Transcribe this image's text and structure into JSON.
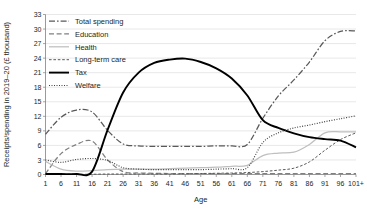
{
  "chart_data": {
    "type": "line",
    "title": "",
    "xlabel": "Age",
    "ylabel": "Receipts/spending in 2019–20 (£ thousand)",
    "ylim": [
      0,
      33
    ],
    "ytick_step": 3,
    "yticks": [
      "0",
      "3",
      "6",
      "9",
      "12",
      "15",
      "18",
      "21",
      "24",
      "27",
      "30",
      "33"
    ],
    "xticks": [
      "1",
      "6",
      "11",
      "16",
      "21",
      "26",
      "31",
      "36",
      "41",
      "46",
      "51",
      "56",
      "61",
      "66",
      "71",
      "76",
      "81",
      "86",
      "91",
      "96",
      "101+"
    ],
    "xlim": [
      1,
      101
    ],
    "grid": "horizontal",
    "legend_position": "top-left-inside",
    "x": [
      1,
      6,
      11,
      16,
      21,
      26,
      31,
      36,
      41,
      46,
      51,
      56,
      61,
      66,
      71,
      76,
      81,
      86,
      91,
      96,
      101
    ],
    "series": [
      {
        "name": "Total spending",
        "style": "dash-dot",
        "color": "#595959",
        "values": [
          8.3,
          11.8,
          13.3,
          12.9,
          9.1,
          6.3,
          5.9,
          5.8,
          5.8,
          5.8,
          5.8,
          5.9,
          5.9,
          6.2,
          11.6,
          16.2,
          19.5,
          23.2,
          27.6,
          29.5,
          29.6
        ]
      },
      {
        "name": "Education",
        "style": "dashed",
        "color": "#808080",
        "values": [
          0.2,
          4.3,
          6.2,
          6.9,
          3.0,
          0.6,
          0.3,
          0.25,
          0.2,
          0.2,
          0.2,
          0.2,
          0.2,
          0.2,
          0.2,
          0.2,
          0.2,
          0.2,
          0.2,
          0.2,
          0.2
        ]
      },
      {
        "name": "Health",
        "style": "solid-light",
        "color": "#bfbfbf",
        "values": [
          2.7,
          1.1,
          0.7,
          0.8,
          1.0,
          1.1,
          1.1,
          1.1,
          1.2,
          1.3,
          1.4,
          1.5,
          1.7,
          1.9,
          3.9,
          4.4,
          4.6,
          6.2,
          8.6,
          8.8,
          8.8
        ]
      },
      {
        "name": "Long-term care",
        "style": "fine-dashed",
        "color": "#595959",
        "values": [
          0.05,
          0.05,
          0.05,
          0.05,
          0.1,
          0.1,
          0.1,
          0.1,
          0.1,
          0.15,
          0.2,
          0.25,
          0.3,
          0.4,
          0.6,
          0.9,
          1.3,
          2.6,
          5.0,
          7.2,
          8.6
        ]
      },
      {
        "name": "Tax",
        "style": "solid-bold",
        "color": "#000000",
        "values": [
          0.1,
          0.1,
          0.1,
          0.6,
          9.2,
          16.9,
          21.0,
          23.0,
          23.7,
          23.9,
          23.2,
          21.9,
          19.8,
          16.3,
          11.2,
          9.6,
          8.5,
          7.7,
          7.3,
          7.0,
          5.6
        ]
      },
      {
        "name": "Welfare",
        "style": "dotted",
        "color": "#404040",
        "values": [
          3.0,
          2.5,
          3.1,
          3.3,
          2.9,
          1.4,
          1.1,
          1.0,
          1.0,
          1.0,
          1.0,
          1.1,
          1.2,
          1.4,
          6.6,
          8.6,
          9.6,
          10.2,
          10.9,
          11.5,
          12.1
        ]
      }
    ]
  },
  "legend": {
    "items": [
      {
        "label": "Total spending"
      },
      {
        "label": "Education"
      },
      {
        "label": "Health"
      },
      {
        "label": "Long-term care"
      },
      {
        "label": "Tax"
      },
      {
        "label": "Welfare"
      }
    ]
  }
}
